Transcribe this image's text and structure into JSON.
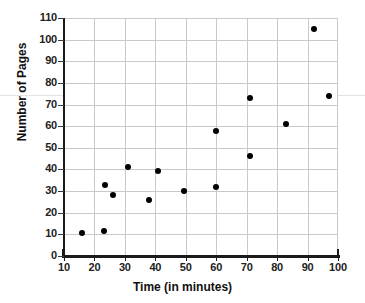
{
  "chart_data": {
    "type": "scatter",
    "title": "",
    "xlabel": "Time (in minutes)",
    "ylabel": "Number of Pages",
    "xlim": [
      10,
      100
    ],
    "ylim": [
      0,
      110
    ],
    "xticks": [
      10,
      20,
      30,
      40,
      50,
      60,
      70,
      80,
      90,
      100
    ],
    "yticks": [
      0,
      10,
      20,
      30,
      40,
      50,
      60,
      70,
      80,
      90,
      100,
      110
    ],
    "xtick_labels": [
      "10",
      "20",
      "30",
      "40",
      "50",
      "60",
      "70",
      "80",
      "90",
      "100"
    ],
    "ytick_labels": [
      "0",
      "10",
      "20",
      "30",
      "40",
      "50",
      "60",
      "70",
      "80",
      "90",
      "100",
      "110"
    ],
    "grid": true,
    "legend": null,
    "marker": "filled-circle",
    "marker_color": "#000000",
    "grid_color": "#c9c9c9",
    "axis_color": "#1a1a1a",
    "points": [
      {
        "x": 16,
        "y": 10.5
      },
      {
        "x": 23,
        "y": 11.5
      },
      {
        "x": 23.5,
        "y": 33
      },
      {
        "x": 26,
        "y": 28
      },
      {
        "x": 31,
        "y": 41
      },
      {
        "x": 38,
        "y": 26
      },
      {
        "x": 41,
        "y": 39.5
      },
      {
        "x": 49.5,
        "y": 30
      },
      {
        "x": 60,
        "y": 32
      },
      {
        "x": 60,
        "y": 58
      },
      {
        "x": 71,
        "y": 46
      },
      {
        "x": 71,
        "y": 73
      },
      {
        "x": 83,
        "y": 61
      },
      {
        "x": 92,
        "y": 105
      },
      {
        "x": 97,
        "y": 74
      }
    ]
  }
}
